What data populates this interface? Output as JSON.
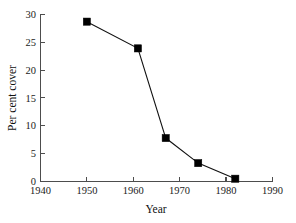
{
  "chart_data": {
    "type": "line",
    "title": "",
    "xlabel": "Year",
    "ylabel": "Per cent cover",
    "xlim": [
      1940,
      1990
    ],
    "ylim": [
      0,
      30
    ],
    "xticks": [
      1940,
      1950,
      1960,
      1970,
      1980,
      1990
    ],
    "xtick_labels": [
      "1940",
      "1950",
      "1960",
      "1970",
      "1980",
      "1990"
    ],
    "yticks": [
      0,
      5,
      10,
      15,
      20,
      25,
      30
    ],
    "ytick_labels": [
      "0",
      "5",
      "10",
      "15",
      "20",
      "25",
      "30"
    ],
    "grid": false,
    "legend": null,
    "marker": "filled-square",
    "series": [
      {
        "name": "Per cent cover",
        "color": "#000000",
        "x": [
          1950,
          1961,
          1967,
          1974,
          1982
        ],
        "values": [
          28.7,
          23.9,
          7.8,
          3.3,
          0.5
        ]
      }
    ]
  },
  "axes": {
    "y_axis_label": "Per cent cover",
    "x_axis_label": "Year"
  }
}
